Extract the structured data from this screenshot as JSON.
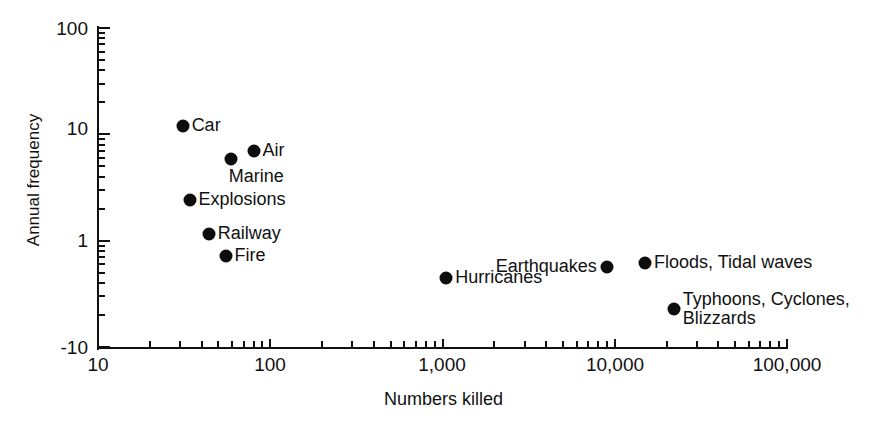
{
  "chart_data": {
    "type": "scatter",
    "title": "",
    "xlabel": "Numbers killed",
    "ylabel": "Annual frequency",
    "xscale": "log",
    "yscale": "log",
    "xlim": [
      10,
      100000
    ],
    "ylim": [
      0.1,
      100
    ],
    "grid": false,
    "legend": "none",
    "xticks": [
      {
        "value": 10,
        "label": "10"
      },
      {
        "value": 100,
        "label": "100"
      },
      {
        "value": 1000,
        "label": "1,000"
      },
      {
        "value": 10000,
        "label": "10,000"
      },
      {
        "value": 100000,
        "label": "100,000"
      }
    ],
    "yticks": [
      {
        "value": 100,
        "label": "100"
      },
      {
        "value": 10,
        "label": "10"
      },
      {
        "value": 1,
        "label": "1"
      },
      {
        "value": 0.1,
        "label": "-10"
      }
    ],
    "marker": {
      "shape": "circle",
      "color": "#0d0d0d",
      "size": 13
    },
    "points": [
      {
        "label": "Car",
        "x": 31,
        "y": 12.0,
        "label_side": "right"
      },
      {
        "label": "Air",
        "x": 80,
        "y": 7.0,
        "label_side": "right"
      },
      {
        "label": "Marine",
        "x": 59,
        "y": 5.8,
        "label_side": "below-right"
      },
      {
        "label": "Explosions",
        "x": 34,
        "y": 2.4,
        "label_side": "right"
      },
      {
        "label": "Railway",
        "x": 44,
        "y": 1.15,
        "label_side": "right"
      },
      {
        "label": "Fire",
        "x": 55,
        "y": 0.72,
        "label_side": "right"
      },
      {
        "label": "Hurricanes",
        "x": 1050,
        "y": 0.45,
        "label_side": "right"
      },
      {
        "label": "Earthquakes",
        "x": 9000,
        "y": 0.56,
        "label_side": "left"
      },
      {
        "label": "Floods, Tidal waves",
        "x": 15000,
        "y": 0.62,
        "label_side": "right"
      },
      {
        "label": "Typhoons, Cyclones,\nBlizzards",
        "x": 22000,
        "y": 0.23,
        "label_side": "right"
      }
    ]
  },
  "axis": {
    "x_title": "Numbers killed",
    "y_title": "Annual frequency"
  },
  "xtick_labels": {
    "t0": "10",
    "t1": "100",
    "t2": "1,000",
    "t3": "10,000",
    "t4": "100,000"
  },
  "ytick_labels": {
    "t0": "100",
    "t1": "10",
    "t2": "1",
    "t3": "-10"
  },
  "point_labels": {
    "car": "Car",
    "air": "Air",
    "marine": "Marine",
    "explosions": "Explosions",
    "railway": "Railway",
    "fire": "Fire",
    "hurricanes": "Hurricanes",
    "earthquakes": "Earthquakes",
    "floods": "Floods, Tidal waves",
    "typhoons_line1": "Typhoons, Cyclones,",
    "typhoons_line2": "Blizzards"
  }
}
